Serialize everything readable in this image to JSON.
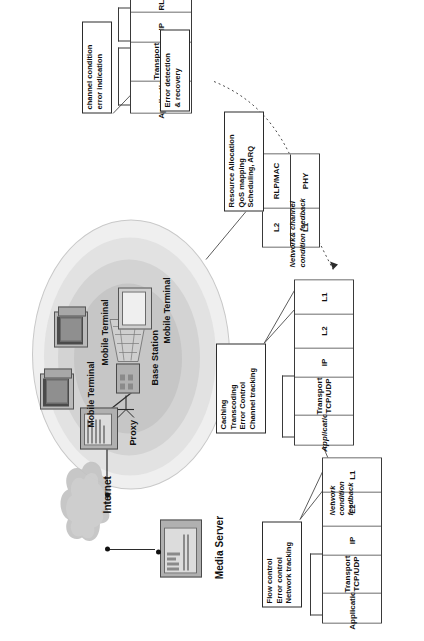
{
  "figure": {
    "title_present": false,
    "orientation": "rotated-90",
    "topology": {
      "media_server_label": "Media Server",
      "internet_label": "Internet",
      "proxy_label": "Proxy",
      "base_station_label": "Base Station",
      "mobile_terminal_labels": [
        "Mobile Terminal",
        "Mobile Terminal",
        "Mobile Terminal"
      ]
    },
    "stacks": [
      {
        "id": "media-server-stack",
        "layers": [
          "Application",
          "Transport\nTCP/UDP",
          "IP",
          "L2",
          "L1"
        ],
        "application_italic": false
      },
      {
        "id": "proxy-stack",
        "layers": [
          "Application",
          "Transport\nTCP/UDP",
          "IP",
          "L2",
          "L1"
        ],
        "application_italic": true
      },
      {
        "id": "base-station-stack",
        "upper": [
          "RLP/MAC",
          "PHY"
        ],
        "lower": [
          "L2",
          "L1"
        ]
      },
      {
        "id": "mobile-terminal-stack",
        "layers": [
          "Application",
          "Transport\nTCP/UDP",
          "IP",
          "RLP/MAC",
          "PHY"
        ],
        "application_italic": false
      }
    ],
    "annotations": [
      {
        "id": "server-functions",
        "lines": [
          "Flow control",
          "Error control",
          "Network tracking"
        ]
      },
      {
        "id": "proxy-functions",
        "lines": [
          "Caching",
          "Transcoding",
          "Error Control",
          "Channel tracking"
        ]
      },
      {
        "id": "bs-functions",
        "lines": [
          "Resource Allocation",
          "QoS mapping",
          "Scheduling, ARQ"
        ]
      },
      {
        "id": "mt-error-functions",
        "lines": [
          "Error detection",
          "& recovery"
        ]
      },
      {
        "id": "mt-channel-functions",
        "lines": [
          "channel condition",
          "error indication"
        ]
      }
    ],
    "feedback_arrows": [
      {
        "id": "network-condition-feedback",
        "lines": [
          "Network",
          "condition",
          "feedback"
        ],
        "style": "solid"
      },
      {
        "id": "network-channel-condition-feedback",
        "lines": [
          "Network& channel",
          "condition feedback"
        ],
        "style": "dotted"
      }
    ]
  },
  "colors": {
    "line": "#2b2b2b",
    "box_border": "#3a3a3a",
    "cell_zone_outer": "#efefef",
    "cell_zone_mid": "#d3d3d3",
    "cell_zone_inner": "#c6c6c6",
    "cloud": "#bdbdbd",
    "device": "#b9b9b9",
    "text": "#111111"
  }
}
